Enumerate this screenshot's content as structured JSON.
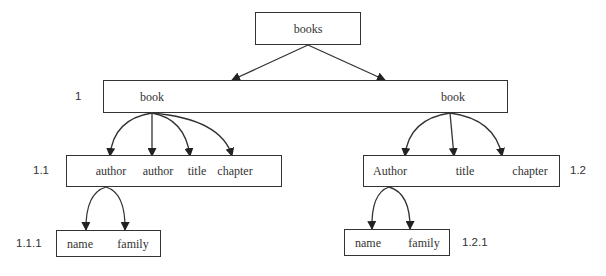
{
  "diagram": {
    "type": "xml-tree",
    "root": {
      "id": "books",
      "label": "books",
      "box": {
        "x": 255,
        "y": 12,
        "w": 106,
        "h": 33
      },
      "texts": [
        {
          "text": "books",
          "x": 308,
          "y": 22
        }
      ]
    },
    "level1": {
      "id": "book-container",
      "number_label": "1",
      "box": {
        "x": 103,
        "y": 80,
        "w": 405,
        "h": 33
      },
      "texts": [
        {
          "text": "book",
          "x": 152,
          "y": 90
        },
        {
          "text": "book",
          "x": 453,
          "y": 90
        }
      ]
    },
    "level2": [
      {
        "id": "node-1-1",
        "number_label": "1.1",
        "box": {
          "x": 66,
          "y": 155,
          "w": 216,
          "h": 32
        },
        "texts": [
          {
            "text": "author",
            "x": 111,
            "y": 164
          },
          {
            "text": "author",
            "x": 158,
            "y": 164
          },
          {
            "text": "title",
            "x": 197,
            "y": 164
          },
          {
            "text": "chapter",
            "x": 235,
            "y": 164
          }
        ]
      },
      {
        "id": "node-1-2",
        "number_label": "1.2",
        "box": {
          "x": 363,
          "y": 155,
          "w": 197,
          "h": 32
        },
        "texts": [
          {
            "text": "Author",
            "x": 390,
            "y": 164
          },
          {
            "text": "title",
            "x": 465,
            "y": 164
          },
          {
            "text": "chapter",
            "x": 530,
            "y": 164
          }
        ]
      }
    ],
    "level3": [
      {
        "id": "node-1-1-1",
        "number_label": "1.1.1",
        "box": {
          "x": 56,
          "y": 230,
          "w": 105,
          "h": 27
        },
        "texts": [
          {
            "text": "name",
            "x": 80,
            "y": 237
          },
          {
            "text": "family",
            "x": 133,
            "y": 237
          }
        ]
      },
      {
        "id": "node-1-2-1",
        "number_label": "1.2.1",
        "box": {
          "x": 344,
          "y": 229,
          "w": 106,
          "h": 27
        },
        "texts": [
          {
            "text": "name",
            "x": 368,
            "y": 236
          },
          {
            "text": "family",
            "x": 424,
            "y": 236
          }
        ]
      }
    ],
    "number_labels": [
      {
        "text": "1",
        "x": 75,
        "y": 90
      },
      {
        "text": "1.1",
        "x": 33,
        "y": 164
      },
      {
        "text": "1.2",
        "x": 570,
        "y": 164
      },
      {
        "text": "1.1.1",
        "x": 16,
        "y": 237
      },
      {
        "text": "1.2.1",
        "x": 462,
        "y": 236
      }
    ],
    "edges": [
      {
        "from": [
          308,
          45
        ],
        "to": [
          232,
          80
        ],
        "curve": 0
      },
      {
        "from": [
          308,
          45
        ],
        "to": [
          385,
          80
        ],
        "curve": 0
      },
      {
        "from": [
          152,
          113
        ],
        "to": [
          110,
          156
        ],
        "curve": -10
      },
      {
        "from": [
          152,
          113
        ],
        "to": [
          152,
          156
        ],
        "curve": 0
      },
      {
        "from": [
          152,
          113
        ],
        "to": [
          190,
          156
        ],
        "curve": 3
      },
      {
        "from": [
          152,
          113
        ],
        "to": [
          232,
          156
        ],
        "curve": 5
      },
      {
        "from": [
          450,
          113
        ],
        "to": [
          405,
          156
        ],
        "curve": -10
      },
      {
        "from": [
          450,
          113
        ],
        "to": [
          454,
          156
        ],
        "curve": 0
      },
      {
        "from": [
          450,
          113
        ],
        "to": [
          502,
          156
        ],
        "curve": 3
      },
      {
        "from": [
          106,
          187
        ],
        "to": [
          86,
          230
        ],
        "curve": -12
      },
      {
        "from": [
          106,
          187
        ],
        "to": [
          125,
          230
        ],
        "curve": 12
      },
      {
        "from": [
          389,
          187
        ],
        "to": [
          372,
          229
        ],
        "curve": -12
      },
      {
        "from": [
          389,
          187
        ],
        "to": [
          410,
          229
        ],
        "curve": 12
      }
    ],
    "colors": {
      "stroke": "#333333",
      "background": "#ffffff",
      "text": "#333333"
    }
  }
}
